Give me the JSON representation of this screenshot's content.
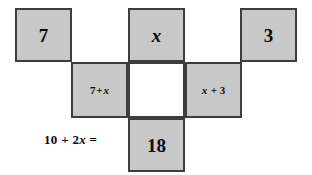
{
  "diagram": {
    "type": "addition-pyramid",
    "colors": {
      "shaded_fill": "#c8c8c8",
      "empty_fill": "#ffffff",
      "border": "#3d3d3d",
      "text": "#0a0a0a"
    },
    "cells": {
      "top_left": "7",
      "top_middle": "x",
      "top_right": "3",
      "middle_left": "7 + x",
      "middle_center": "",
      "middle_right": "x + 3",
      "bottom": "18"
    },
    "equation": {
      "full": "10 + 2x =",
      "lead": "10 + 2",
      "variable": "x",
      "operator": " ="
    }
  }
}
